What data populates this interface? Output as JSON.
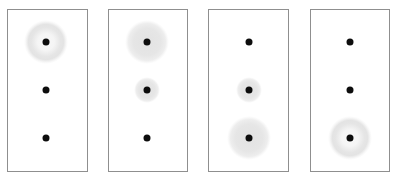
{
  "figure": {
    "background_color": "#ffffff",
    "panel_border_color": "#8f8f8f",
    "dot_color": "#0d0d0d",
    "halo_color": "#e4e4e4",
    "panel_count": 4,
    "rows_per_panel": 3
  },
  "chart_data": {
    "type": "scatter",
    "subtitle": "",
    "xlabel": "",
    "ylabel": "",
    "grid": false,
    "legend": "none",
    "row_labels": [
      "top",
      "middle",
      "bottom"
    ],
    "panel_labels": [
      "1",
      "2",
      "3",
      "4"
    ],
    "halo_style_legend": [
      {
        "style": "none",
        "description": "bare dot, no halo"
      },
      {
        "style": "ring",
        "description": "annulus halo, bright rim"
      },
      {
        "style": "disc-medium",
        "description": "filled soft disc, medium"
      },
      {
        "style": "disc-large",
        "description": "filled soft disc, large"
      }
    ],
    "panels": [
      {
        "index": 1,
        "rect": {
          "x": 7,
          "y": 9,
          "w": 81,
          "h": 163
        },
        "markers": [
          {
            "row": "top",
            "cx": 46,
            "cy": 42,
            "dot_d": 7,
            "halo_style": "ring",
            "halo_d": 44
          },
          {
            "row": "middle",
            "cx": 46,
            "cy": 90,
            "dot_d": 7,
            "halo_style": "none",
            "halo_d": 0
          },
          {
            "row": "bottom",
            "cx": 46,
            "cy": 138,
            "dot_d": 7,
            "halo_style": "none",
            "halo_d": 0
          }
        ]
      },
      {
        "index": 2,
        "rect": {
          "x": 108,
          "y": 9,
          "w": 80,
          "h": 163
        },
        "markers": [
          {
            "row": "top",
            "cx": 147,
            "cy": 42,
            "dot_d": 7,
            "halo_style": "disc-large",
            "halo_d": 44
          },
          {
            "row": "middle",
            "cx": 147,
            "cy": 90,
            "dot_d": 7,
            "halo_style": "disc-medium",
            "halo_d": 26
          },
          {
            "row": "bottom",
            "cx": 147,
            "cy": 138,
            "dot_d": 7,
            "halo_style": "none",
            "halo_d": 0
          }
        ]
      },
      {
        "index": 3,
        "rect": {
          "x": 208,
          "y": 9,
          "w": 81,
          "h": 163
        },
        "markers": [
          {
            "row": "top",
            "cx": 249,
            "cy": 42,
            "dot_d": 7,
            "halo_style": "none",
            "halo_d": 0
          },
          {
            "row": "middle",
            "cx": 249,
            "cy": 90,
            "dot_d": 7,
            "halo_style": "disc-medium",
            "halo_d": 26
          },
          {
            "row": "bottom",
            "cx": 249,
            "cy": 138,
            "dot_d": 7,
            "halo_style": "disc-large",
            "halo_d": 44
          }
        ]
      },
      {
        "index": 4,
        "rect": {
          "x": 310,
          "y": 9,
          "w": 80,
          "h": 163
        },
        "markers": [
          {
            "row": "top",
            "cx": 350,
            "cy": 42,
            "dot_d": 7,
            "halo_style": "none",
            "halo_d": 0
          },
          {
            "row": "middle",
            "cx": 350,
            "cy": 90,
            "dot_d": 7,
            "halo_style": "none",
            "halo_d": 0
          },
          {
            "row": "bottom",
            "cx": 350,
            "cy": 138,
            "dot_d": 7,
            "halo_style": "ring",
            "halo_d": 44
          }
        ]
      }
    ]
  }
}
